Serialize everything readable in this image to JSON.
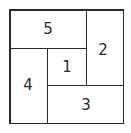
{
  "diagram": {
    "type": "rectangle-partition",
    "border_color": "#2a2a2a",
    "regions": [
      {
        "id": "5",
        "label": "5"
      },
      {
        "id": "2",
        "label": "2"
      },
      {
        "id": "1",
        "label": "1"
      },
      {
        "id": "4",
        "label": "4"
      },
      {
        "id": "3",
        "label": "3"
      }
    ]
  }
}
